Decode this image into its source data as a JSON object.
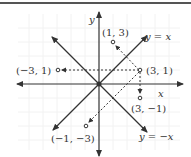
{
  "diagram": {
    "title": "",
    "axes": {
      "x_label": "x",
      "y_label": "y",
      "unit_px": 14,
      "origin": [
        99,
        84
      ]
    },
    "lines": [
      {
        "label": "y = x",
        "eq": "y=x"
      },
      {
        "label": "y = −x",
        "eq": "y=-x"
      }
    ],
    "points": [
      {
        "label": "(3, 1)",
        "x": 3,
        "y": 1
      },
      {
        "label": "(1, 3)",
        "x": 1,
        "y": 3
      },
      {
        "label": "(−3, 1)",
        "x": -3,
        "y": 1
      },
      {
        "label": "(3, −1)",
        "x": 3,
        "y": -1
      },
      {
        "label": "(−1, −3)",
        "x": -1,
        "y": -3
      }
    ],
    "arrows_from": "(3, 1)",
    "colors": {
      "line": "#333333",
      "grid": "#f0f0f0",
      "border": "#555555"
    }
  }
}
